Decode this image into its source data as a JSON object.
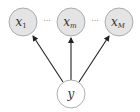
{
  "diagram": {
    "type": "graphical-model",
    "colors": {
      "observed_fill": "#e4e4e4",
      "latent_fill": "#ffffff",
      "stroke": "#9a9a9a",
      "edge": "#222222"
    },
    "nodes": [
      {
        "id": "x1",
        "label": "x",
        "sub": "1",
        "cx": 23,
        "cy": 22,
        "r": 14,
        "shaded": true
      },
      {
        "id": "xm",
        "label": "x",
        "sub": "m",
        "cx": 71,
        "cy": 22,
        "r": 14,
        "shaded": true
      },
      {
        "id": "xM",
        "label": "x",
        "sub": "M",
        "cx": 119,
        "cy": 22,
        "r": 14,
        "shaded": true
      },
      {
        "id": "y",
        "label": "y",
        "sub": "",
        "cx": 71,
        "cy": 94,
        "r": 14,
        "shaded": false
      }
    ],
    "ellipses": [
      {
        "between": [
          "x1",
          "xm"
        ],
        "text": "···"
      },
      {
        "between": [
          "xm",
          "xM"
        ],
        "text": "···"
      }
    ],
    "edges": [
      {
        "from": "y",
        "to": "x1"
      },
      {
        "from": "y",
        "to": "xm"
      },
      {
        "from": "y",
        "to": "xM"
      }
    ]
  }
}
